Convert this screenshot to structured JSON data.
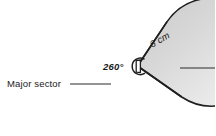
{
  "figure": {
    "background_color": "#ffffff"
  },
  "circle": {
    "center_x": 137.5,
    "center_y": 66,
    "radius": 54,
    "outline_color": "#1f1f1f",
    "outline_width": 1.6
  },
  "major_sector": {
    "label": "Major sector",
    "angle_label": "260°",
    "angle_degrees": 260,
    "fill_light": "#f2f2f2",
    "fill_dark": "#c8c8c8",
    "start_angle_deg": 35,
    "end_angle_deg": 295
  },
  "minor_sector": {
    "angle_degrees": 100,
    "fill": "#ffffff"
  },
  "radius_label": {
    "text": "6 cm",
    "value": 6,
    "unit": "cm"
  },
  "leaders": {
    "major_sector_line_color": "#2b2b2b",
    "right_line_color": "#2b2b2b"
  },
  "angle_marker": {
    "name": "angle-arc-marker",
    "color": "#1f1f1f"
  }
}
